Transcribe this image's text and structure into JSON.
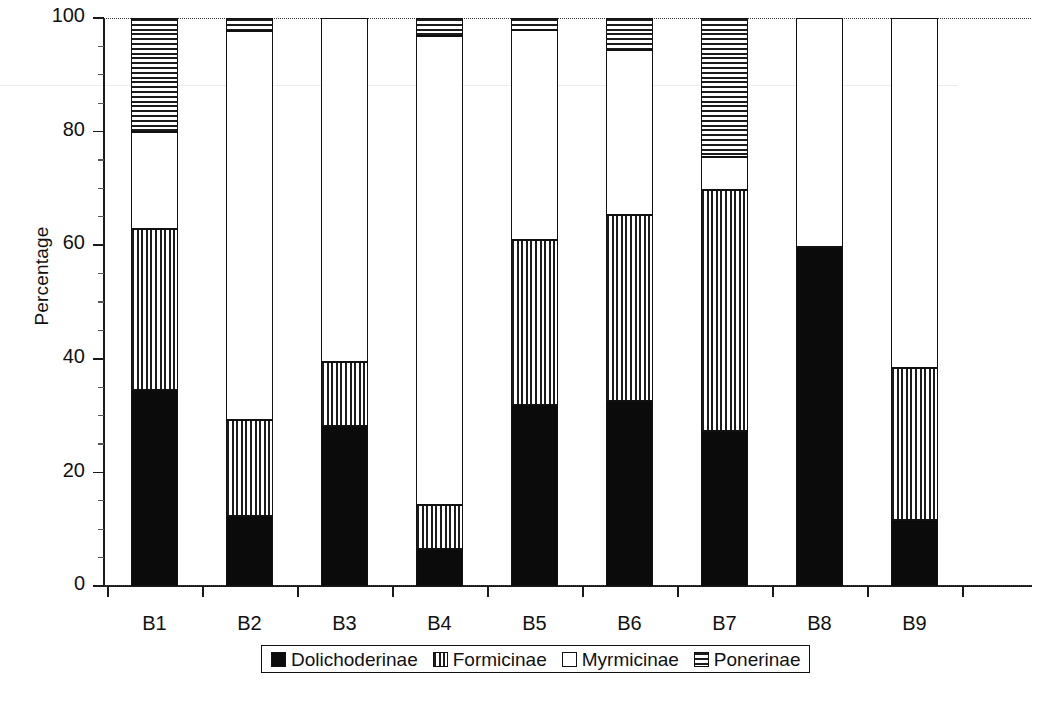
{
  "chart_data": {
    "type": "bar",
    "subtype": "stacked-percentage-column",
    "title": "",
    "xlabel": "",
    "ylabel": "Percentage",
    "ylim": [
      0,
      100
    ],
    "yticks": [
      0,
      20,
      40,
      60,
      80,
      100
    ],
    "ytick_labels": [
      "0",
      "20",
      "40",
      "60",
      "80",
      "100"
    ],
    "grid": false,
    "legend_position": "bottom-center",
    "categories": [
      "B1",
      "B2",
      "B3",
      "B4",
      "B5",
      "B6",
      "B7",
      "B8",
      "B9"
    ],
    "series": [
      {
        "name": "Dolichoderinae",
        "pattern": "solid-black",
        "values": [
          34.5,
          12.3,
          28.1,
          6.5,
          31.8,
          32.6,
          27.3,
          59.6,
          11.7
        ]
      },
      {
        "name": "Formicinae",
        "pattern": "vertical-lines",
        "values": [
          28.3,
          16.9,
          11.4,
          7.8,
          29.2,
          32.7,
          42.4,
          0.0,
          26.7
        ]
      },
      {
        "name": "Myrmicinae",
        "pattern": "open-white",
        "values": [
          17.2,
          68.5,
          60.5,
          82.5,
          36.8,
          29.0,
          5.8,
          40.4,
          61.6
        ]
      },
      {
        "name": "Ponerinae",
        "pattern": "horizontal-lines",
        "values": [
          20.0,
          2.3,
          0.0,
          3.2,
          2.2,
          5.7,
          24.5,
          0.0,
          0.0
        ]
      }
    ]
  },
  "legend": {
    "items": [
      {
        "label": "Dolichoderinae",
        "pattern": "solid-black"
      },
      {
        "label": "Formicinae",
        "pattern": "vertical-lines"
      },
      {
        "label": "Myrmicinae",
        "pattern": "open-white"
      },
      {
        "label": "Ponerinae",
        "pattern": "horizontal-lines"
      }
    ]
  },
  "colors": {
    "ink": "#0b0b0b",
    "axis": "#1a1a1a",
    "background": "#ffffff"
  }
}
